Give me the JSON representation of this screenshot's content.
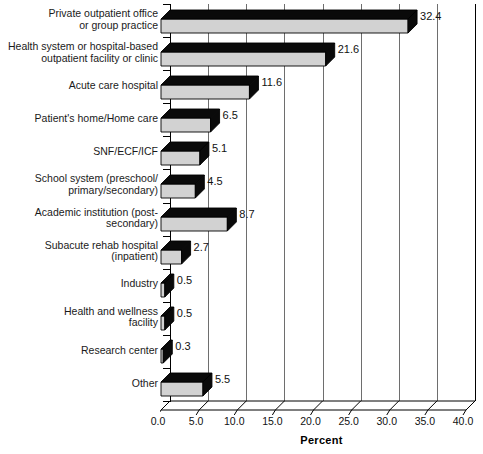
{
  "chart_data": {
    "type": "bar",
    "orientation": "horizontal",
    "title": "",
    "xlabel": "Percent",
    "ylabel": "",
    "xlim": [
      0.0,
      40.0
    ],
    "xticks": [
      "0.0",
      "5.0",
      "10.0",
      "15.0",
      "20.0",
      "25.0",
      "30.0",
      "35.0",
      "40.0"
    ],
    "grid": true,
    "legend": "none",
    "style": "3d-bar",
    "categories": [
      "Private outpatient office\nor group practice",
      "Health system or hospital-based\noutpatient facility or clinic",
      "Acute care hospital",
      "Patient's home/Home care",
      "SNF/ECF/ICF",
      "School system (preschool/\nprimary/secondary)",
      "Academic institution (post-\nsecondary)",
      "Subacute rehab hospital\n(inpatient)",
      "Industry",
      "Health and wellness\nfacility",
      "Research center",
      "Other"
    ],
    "values": [
      32.4,
      21.6,
      11.6,
      6.5,
      5.1,
      4.5,
      8.7,
      2.7,
      0.5,
      0.5,
      0.3,
      5.5
    ],
    "value_labels": [
      "32.4",
      "21.6",
      "11.6",
      "6.5",
      "5.1",
      "4.5",
      "8.7",
      "2.7",
      "0.5",
      "0.5",
      "0.3",
      "5.5"
    ],
    "colors": {
      "bar_front": "#d2d2d2",
      "bar_top": "#0a0a0a",
      "bar_end": "#0a0a0a",
      "gridline": "#6e6e6e",
      "axis": "#000000",
      "text": "#111111",
      "background": "#ffffff"
    }
  }
}
